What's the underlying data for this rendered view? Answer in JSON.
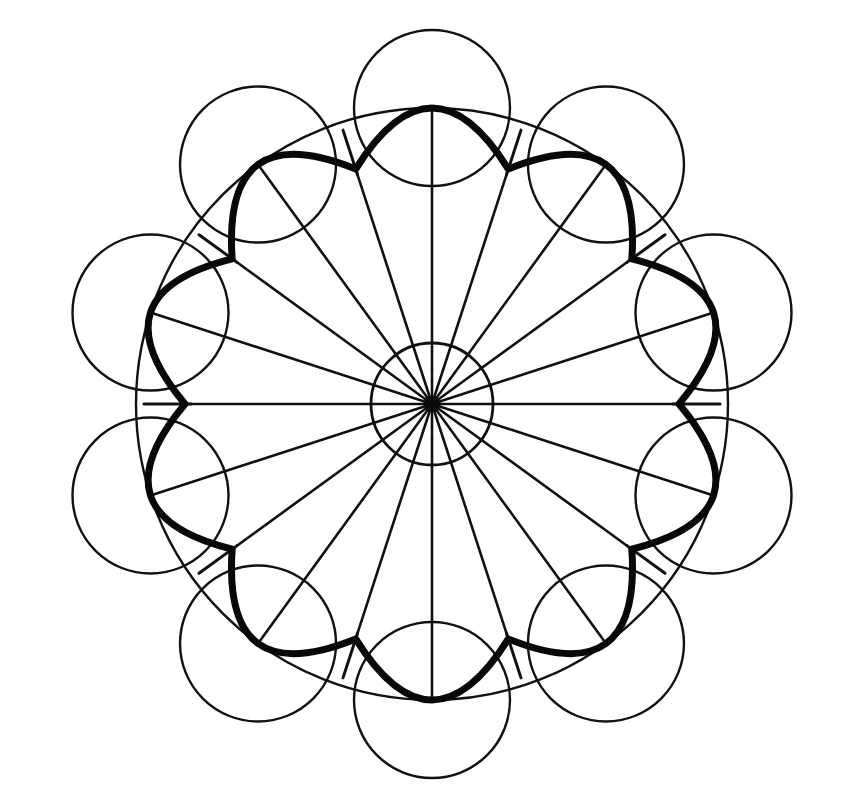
{
  "page": {
    "width": 842,
    "height": 807,
    "background_color": "#ffffff",
    "ink_color": "#111111"
  },
  "figure": {
    "name": "ten-fold-rosette-mandala",
    "center": {
      "x": 432,
      "y": 404
    },
    "symmetry_order": 10,
    "stroke_style": "hand-inked, slightly irregular"
  },
  "geometry": {
    "outer_circle": {
      "label": "outer-circle",
      "cx": 432,
      "cy": 404,
      "r": 296,
      "stroke_width": 2.4,
      "stroke_color": "#111111",
      "filled": false
    },
    "hub_circle": {
      "label": "hub-circle",
      "cx": 432,
      "cy": 404,
      "r": 61,
      "stroke_width": 2.8,
      "stroke_color": "#111111",
      "filled": false
    },
    "hub_dot": {
      "label": "hub-dot",
      "cx": 432,
      "cy": 404,
      "r": 8,
      "fill": "#0a0a0a"
    },
    "petal_circles": {
      "label": "petal-circles",
      "count": 10,
      "r": 78,
      "center_radius": 296,
      "start_angle_deg": 90,
      "step_deg": 36,
      "stroke_width": 2.4,
      "stroke_color": "#111111",
      "angles_deg": [
        90,
        126,
        162,
        198,
        234,
        270,
        306,
        342,
        18,
        54
      ]
    },
    "scallop": {
      "label": "bold-scalloped-curve",
      "lobe_count": 10,
      "peak_radius": 296,
      "cusp_radius": 247,
      "peak_angles_deg": [
        90,
        126,
        162,
        198,
        234,
        270,
        306,
        342,
        18,
        54
      ],
      "cusp_angles_deg": [
        108,
        144,
        180,
        216,
        252,
        288,
        324,
        0,
        36,
        72
      ],
      "stroke_width": 7.0,
      "stroke_color": "#080808",
      "bulge": 0.55
    },
    "spokes": {
      "label": "radial-spokes",
      "count": 20,
      "step_deg": 18,
      "start_angle_deg": 0,
      "stroke_width": 2.6,
      "stroke_color": "#111111",
      "long_spoke_radius": 296,
      "short_spoke_radius": 247,
      "long_spoke_angles_deg": [
        0,
        18,
        36,
        54,
        72,
        90,
        108,
        126,
        144,
        162,
        180,
        198,
        216,
        234,
        252,
        270,
        288,
        306,
        324,
        342
      ],
      "note": "All twenty spokes run from the hub centre outward; those landing on a cusp stop at the cusp radius, those landing on a lobe peak continue to the outer circle."
    },
    "cusp_ticks": {
      "label": "cusp-tick-marks",
      "count": 10,
      "inner_radius": 247,
      "outer_radius": 296,
      "angles_deg": [
        0,
        36,
        72,
        108,
        144,
        180,
        216,
        252,
        288,
        324
      ],
      "stroke_width": 3.0,
      "stroke_color": "#111111",
      "note": "Short straight extensions of the cusp spokes projecting past the scalloped curve toward the outer circle."
    }
  },
  "chart_data": {
    "type": "scatter",
    "xlabel": "",
    "ylabel": "",
    "xlim": [
      0,
      842
    ],
    "ylim": [
      0,
      807
    ],
    "grid": false,
    "legend": "none",
    "annotations": [
      "outer circle r=296",
      "hub circle r=61",
      "10 petal circles r=78",
      "10-lobed bold scallop, peaks r=296, cusps r=247",
      "20 radial spokes every 18 deg",
      "10 cusp tick marks"
    ],
    "series": [
      {
        "name": "petal-circle-centers",
        "x": [
          432,
          258,
          150,
          150,
          258,
          432,
          606,
          714,
          714,
          606
        ],
        "y": [
          108,
          170,
          308,
          500,
          638,
          700,
          638,
          500,
          308,
          170
        ],
        "values": [
          78,
          78,
          78,
          78,
          78,
          78,
          78,
          78,
          78,
          78
        ]
      },
      {
        "name": "scallop-peaks",
        "x": [
          432,
          258,
          150,
          150,
          258,
          432,
          606,
          714,
          714,
          606
        ],
        "y": [
          108,
          170,
          308,
          500,
          638,
          700,
          638,
          500,
          308,
          170
        ],
        "values": [
          296,
          296,
          296,
          296,
          296,
          296,
          296,
          296,
          296,
          296
        ]
      },
      {
        "name": "scallop-cusps",
        "x": [
          356,
          232,
          185,
          309,
          432,
          556,
          680,
          728,
          604,
          356
        ],
        "y": [
          169,
          259,
          404,
          549,
          651,
          549,
          404,
          259,
          169,
          169
        ],
        "values": [
          247,
          247,
          247,
          247,
          247,
          247,
          247,
          247,
          247,
          247
        ]
      }
    ]
  }
}
